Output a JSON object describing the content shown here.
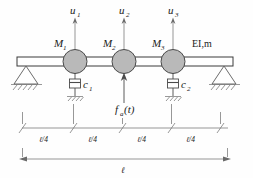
{
  "figure": {
    "type": "structural-beam-diagram"
  },
  "colors": {
    "line": "#2b2b2b",
    "thin_line": "#6b6b6b",
    "mass_fill": "#b9b9b9",
    "mass_stroke": "#4a4a4a",
    "beam_stroke": "#3a3a3a",
    "background": "#fefefe"
  },
  "dof_labels": [
    {
      "name": "u1",
      "base": "u",
      "sub": "1"
    },
    {
      "name": "u2",
      "base": "u",
      "sub": "2"
    },
    {
      "name": "u3",
      "base": "u",
      "sub": "3"
    }
  ],
  "mass_labels": [
    {
      "name": "M1",
      "base": "M",
      "sub": "1"
    },
    {
      "name": "M2",
      "base": "M",
      "sub": "2"
    },
    {
      "name": "M3",
      "base": "M",
      "sub": "3"
    }
  ],
  "damper_labels": [
    {
      "name": "c1",
      "base": "c",
      "sub": "1"
    },
    {
      "name": "c2",
      "base": "c",
      "sub": "2"
    }
  ],
  "beam_property": {
    "label": "EI,m",
    "stiffness": "EI",
    "mass_per_length": "m"
  },
  "applied_force": {
    "base": "f",
    "sub": "a",
    "arg": "(t)",
    "full": "fa(t)",
    "direction": "up"
  },
  "dimensions": {
    "segments": [
      {
        "label": "ℓ/4"
      },
      {
        "label": "ℓ/4"
      },
      {
        "label": "ℓ/4"
      },
      {
        "label": "ℓ/4"
      }
    ],
    "total": {
      "label": "ℓ"
    }
  },
  "supports": [
    {
      "name": "pin-support-left",
      "kind": "triangle-hatched"
    },
    {
      "name": "pin-support-right",
      "kind": "triangle-hatched"
    }
  ]
}
